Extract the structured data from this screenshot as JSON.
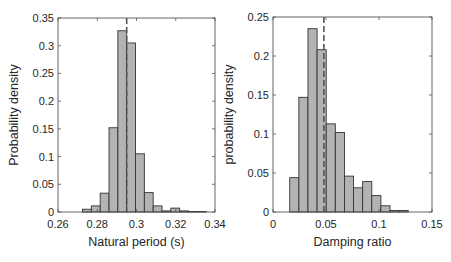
{
  "chart_data": [
    {
      "type": "bar",
      "subtype": "histogram",
      "title": "",
      "xlabel": "Natural period (s)",
      "ylabel": "Probability density",
      "xlim": [
        0.26,
        0.34
      ],
      "ylim": [
        0,
        0.35
      ],
      "xticks": [
        0.26,
        0.28,
        0.3,
        0.32,
        0.34
      ],
      "xtick_labels": [
        "0.26",
        "0.28",
        "0.3",
        "0.32",
        "0.34"
      ],
      "yticks": [
        0,
        0.05,
        0.1,
        0.15,
        0.2,
        0.25,
        0.3,
        0.35
      ],
      "ytick_labels": [
        "0",
        "0.05",
        "0.1",
        "0.15",
        "0.2",
        "0.25",
        "0.3",
        "0.35"
      ],
      "bin_start": 0.2725,
      "bin_width": 0.0045,
      "bin_edges": [
        0.2725,
        0.277,
        0.2815,
        0.286,
        0.2905,
        0.295,
        0.2995,
        0.304,
        0.3085,
        0.313,
        0.3175,
        0.322,
        0.3265,
        0.331,
        0.3355
      ],
      "values": [
        0.005,
        0.011,
        0.034,
        0.152,
        0.327,
        0.305,
        0.105,
        0.035,
        0.011,
        0.002,
        0.007,
        0.002,
        0.001,
        0.001
      ],
      "mean_line": 0.295,
      "bar_color": "#b3b3b3",
      "edge_color": "#333333",
      "grid": false,
      "legend": null
    },
    {
      "type": "bar",
      "subtype": "histogram",
      "title": "",
      "xlabel": "Damping ratio",
      "ylabel": "probability density",
      "xlim": [
        0,
        0.15
      ],
      "ylim": [
        0,
        0.25
      ],
      "xticks": [
        0,
        0.05,
        0.1,
        0.15
      ],
      "xtick_labels": [
        "0",
        "0.05",
        "0.1",
        "0.15"
      ],
      "yticks": [
        0,
        0.05,
        0.1,
        0.15,
        0.2,
        0.25
      ],
      "ytick_labels": [
        "0",
        "0.05",
        "0.1",
        "0.15",
        "0.2",
        "0.25"
      ],
      "bin_start": 0.0158,
      "bin_width": 0.0086,
      "bin_edges": [
        0.0158,
        0.0244,
        0.033,
        0.0416,
        0.0502,
        0.0588,
        0.0674,
        0.076,
        0.0846,
        0.0932,
        0.1018,
        0.1104,
        0.119,
        0.1276
      ],
      "values": [
        0.044,
        0.147,
        0.235,
        0.208,
        0.113,
        0.102,
        0.046,
        0.031,
        0.039,
        0.021,
        0.008,
        0.002,
        0.002
      ],
      "mean_line": 0.048,
      "bar_color": "#b3b3b3",
      "edge_color": "#333333",
      "grid": false,
      "legend": null
    }
  ],
  "layout": {
    "plots": [
      {
        "left": 58,
        "right": 215,
        "top": 18,
        "bottom": 212
      },
      {
        "left": 273,
        "right": 432,
        "top": 17,
        "bottom": 212
      }
    ]
  }
}
